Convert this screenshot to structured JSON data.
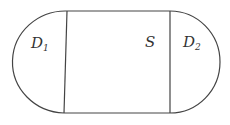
{
  "diagram": {
    "regions": [
      {
        "id": "D1",
        "label": "D",
        "subscript": "1"
      },
      {
        "id": "S",
        "label": "S"
      },
      {
        "id": "D2",
        "label": "D",
        "subscript": "2"
      }
    ],
    "stroke_color": "#444444"
  }
}
